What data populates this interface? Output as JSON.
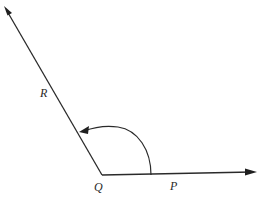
{
  "figure": {
    "type": "angle-diagram",
    "vertex": {
      "label": "Q",
      "x": 102,
      "y": 175
    },
    "rays": [
      {
        "name": "QP",
        "from": "Q",
        "end_x": 255,
        "end_y": 172,
        "label": "P",
        "label_x": 170,
        "label_y": 190
      },
      {
        "name": "QR",
        "from": "Q",
        "end_x": 5,
        "end_y": 8,
        "label": "R",
        "label_x": 40,
        "label_y": 97
      }
    ],
    "arc": {
      "from_ray": "QP",
      "to_ray": "QR",
      "start_x": 151,
      "start_y": 175,
      "end_x": 80,
      "end_y": 131,
      "direction": "counterclockwise",
      "arrowhead_at": "QR"
    },
    "colors": {
      "line": "#2a2a2a",
      "background": "#ffffff"
    }
  },
  "labels": {
    "vertex_q": "Q",
    "point_p": "P",
    "point_r": "R"
  }
}
